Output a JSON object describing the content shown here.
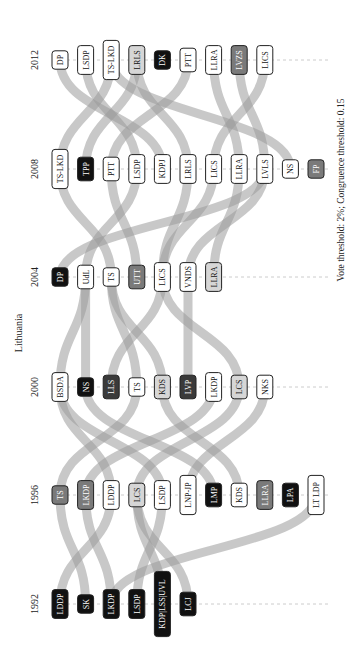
{
  "title": "Lithuania",
  "footnote": "Vote threshold: 2%; Congruence threshold: 0.15",
  "years": [
    {
      "label": "2012",
      "y": 60,
      "parties": [
        {
          "label": "DP",
          "style": "white"
        },
        {
          "label": "LSDP",
          "style": "white"
        },
        {
          "label": "TS-LKD",
          "style": "white"
        },
        {
          "label": "LRLS",
          "style": "light"
        },
        {
          "label": "DK",
          "style": "black"
        },
        {
          "label": "PTT",
          "style": "white"
        },
        {
          "label": "LLRA",
          "style": "white"
        },
        {
          "label": "LVZS",
          "style": "gray"
        },
        {
          "label": "LICS",
          "style": "white"
        }
      ]
    },
    {
      "label": "2008",
      "y": 169,
      "parties": [
        {
          "label": "TS-LKD",
          "style": "white"
        },
        {
          "label": "TPP",
          "style": "black"
        },
        {
          "label": "PTT",
          "style": "white"
        },
        {
          "label": "LSDP",
          "style": "white"
        },
        {
          "label": "KDPJ",
          "style": "white"
        },
        {
          "label": "LRLS",
          "style": "white"
        },
        {
          "label": "LICS",
          "style": "white"
        },
        {
          "label": "LLRA",
          "style": "white"
        },
        {
          "label": "LVLS",
          "style": "white"
        },
        {
          "label": "NS",
          "style": "white"
        },
        {
          "label": "FP",
          "style": "gray"
        }
      ]
    },
    {
      "label": "2004",
      "y": 277,
      "parties": [
        {
          "label": "DP",
          "style": "black"
        },
        {
          "label": "UdL",
          "style": "white"
        },
        {
          "label": "TS",
          "style": "white"
        },
        {
          "label": "UTT",
          "style": "gray"
        },
        {
          "label": "LICS",
          "style": "white"
        },
        {
          "label": "VNDS",
          "style": "white"
        },
        {
          "label": "LLRA",
          "style": "light"
        }
      ]
    },
    {
      "label": "2000",
      "y": 387,
      "parties": [
        {
          "label": "BSDA",
          "style": "white"
        },
        {
          "label": "NS",
          "style": "black"
        },
        {
          "label": "LLS",
          "style": "dark"
        },
        {
          "label": "TS",
          "style": "white"
        },
        {
          "label": "KDS",
          "style": "light"
        },
        {
          "label": "LVP",
          "style": "dark"
        },
        {
          "label": "LKDP",
          "style": "white"
        },
        {
          "label": "LCS",
          "style": "light"
        },
        {
          "label": "NKS",
          "style": "white"
        }
      ]
    },
    {
      "label": "1996",
      "y": 495,
      "parties": [
        {
          "label": "TS",
          "style": "gray"
        },
        {
          "label": "LKDP",
          "style": "gray"
        },
        {
          "label": "LDDP",
          "style": "white"
        },
        {
          "label": "LCS",
          "style": "light"
        },
        {
          "label": "LSDP",
          "style": "white"
        },
        {
          "label": "LNP-JP",
          "style": "white"
        },
        {
          "label": "LMP",
          "style": "black"
        },
        {
          "label": "KDS",
          "style": "white"
        },
        {
          "label": "LLRA",
          "style": "gray"
        },
        {
          "label": "LPA",
          "style": "black"
        },
        {
          "label": "LT LDP",
          "style": "white"
        }
      ]
    },
    {
      "label": "1992",
      "y": 604,
      "parties": [
        {
          "label": "LDDP",
          "style": "black"
        },
        {
          "label": "SK",
          "style": "black"
        },
        {
          "label": "LKDP",
          "style": "black"
        },
        {
          "label": "LSDP",
          "style": "black"
        },
        {
          "label": "KDP|LSS|UVL",
          "style": "black"
        },
        {
          "label": "LCJ",
          "style": "black"
        }
      ]
    }
  ],
  "colors": {
    "band": "#9a9a9a",
    "black": "#111111",
    "dark": "#3a3a3a",
    "gray": "#7a7a7a",
    "light": "#d6d6d6",
    "white": "#ffffff"
  },
  "chart_data": {
    "type": "alluvial",
    "title": "Lithuania",
    "annotation": "Vote threshold: 2%; Congruence threshold: 0.15",
    "orientation": "rotated 90° (time axis runs bottom-to-top)",
    "elections": [
      "1992",
      "1996",
      "2000",
      "2004",
      "2008",
      "2012"
    ],
    "parties_by_election": {
      "1992": [
        "LDDP",
        "SK",
        "LKDP",
        "LSDP",
        "KDP|LSS|UVL",
        "LCJ"
      ],
      "1996": [
        "TS",
        "LKDP",
        "LDDP",
        "LCS",
        "LSDP",
        "LNP-JP",
        "LMP",
        "KDS",
        "LLRA",
        "LPA",
        "LT LDP"
      ],
      "2000": [
        "BSDA",
        "NS",
        "LLS",
        "TS",
        "KDS",
        "LVP",
        "LKDP",
        "LCS",
        "NKS"
      ],
      "2004": [
        "DP",
        "UdL",
        "TS",
        "UTT",
        "LICS",
        "VNDS",
        "LLRA"
      ],
      "2008": [
        "TS-LKD",
        "TPP",
        "PTT",
        "LSDP",
        "KDPJ",
        "LRLS",
        "LICS",
        "LLRA",
        "LVLS",
        "NS",
        "FP"
      ],
      "2012": [
        "DP",
        "LSDP",
        "TS-LKD",
        "LRLS",
        "DK",
        "PTT",
        "LLRA",
        "LVZS",
        "LICS"
      ]
    },
    "flows": [
      [
        "1992:LDDP",
        "1996:LDDP"
      ],
      [
        "1992:SK",
        "1996:TS"
      ],
      [
        "1992:LKDP",
        "1996:LKDP"
      ],
      [
        "1992:LSDP",
        "1996:LSDP"
      ],
      [
        "1992:LKDP",
        "1996:LT LDP"
      ],
      [
        "1992:KDP|LSS|UVL",
        "1996:LCS"
      ],
      [
        "1992:LCJ",
        "1996:LCS"
      ],
      [
        "1996:TS",
        "2000:TS"
      ],
      [
        "1996:LDDP",
        "2000:BSDA"
      ],
      [
        "1996:LSDP",
        "2000:BSDA"
      ],
      [
        "1996:LCS",
        "2000:LCS"
      ],
      [
        "1996:LKDP",
        "2000:LKDP"
      ],
      [
        "1996:KDS",
        "2000:KDS"
      ],
      [
        "1996:LNP-JP",
        "2000:NKS"
      ],
      [
        "1996:LMP",
        "2000:NS"
      ],
      [
        "2000:BSDA",
        "2004:UdL"
      ],
      [
        "2000:NS",
        "2004:UdL"
      ],
      [
        "2000:LLS",
        "2004:LICS"
      ],
      [
        "2000:TS",
        "2004:TS"
      ],
      [
        "2000:LVP",
        "2004:VNDS"
      ],
      [
        "2000:LCS",
        "2004:LICS"
      ],
      [
        "2000:KDS",
        "2004:TS"
      ],
      [
        "2004:DP",
        "2008:LVLS"
      ],
      [
        "2004:UdL",
        "2008:LSDP"
      ],
      [
        "2004:TS",
        "2008:TS-LKD"
      ],
      [
        "2004:UTT",
        "2008:PTT"
      ],
      [
        "2004:LICS",
        "2008:LRLS"
      ],
      [
        "2004:LICS",
        "2008:LICS"
      ],
      [
        "2004:VNDS",
        "2008:LVLS"
      ],
      [
        "2004:LLRA",
        "2008:LLRA"
      ],
      [
        "2008:TS-LKD",
        "2012:TS-LKD"
      ],
      [
        "2008:LSDP",
        "2012:LSDP"
      ],
      [
        "2008:PTT",
        "2012:PTT"
      ],
      [
        "2008:LRLS",
        "2012:LRLS"
      ],
      [
        "2008:LICS",
        "2012:LICS"
      ],
      [
        "2008:LLRA",
        "2012:LLRA"
      ],
      [
        "2008:LVLS",
        "2012:LVZS"
      ],
      [
        "2008:KDPJ",
        "2012:DP"
      ],
      [
        "2008:TPP",
        "2012:LRLS"
      ],
      [
        "2008:NS",
        "2012:TS-LKD"
      ]
    ]
  }
}
